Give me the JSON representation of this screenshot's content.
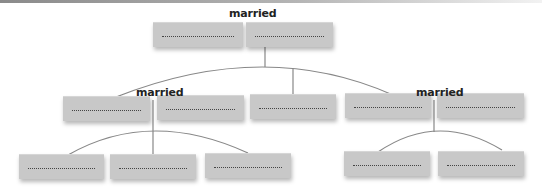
{
  "diagram": {
    "type": "family-tree",
    "relationship_label": "married",
    "colors": {
      "box_fill": "#c8c8c8",
      "field_line": "#444444",
      "connector": "#888888",
      "label_text": "#222222"
    },
    "generations": [
      {
        "name": "grandparents",
        "couples": [
          {
            "label": "married",
            "members": [
              {
                "name": ""
              },
              {
                "name": ""
              }
            ]
          }
        ]
      },
      {
        "name": "parents",
        "couples": [
          {
            "label": "married",
            "members": [
              {
                "name": ""
              },
              {
                "name": ""
              }
            ]
          },
          {
            "label": "",
            "members": [
              {
                "name": ""
              }
            ]
          },
          {
            "label": "married",
            "members": [
              {
                "name": ""
              },
              {
                "name": ""
              }
            ]
          }
        ]
      },
      {
        "name": "children",
        "groups": [
          {
            "members": [
              {
                "name": ""
              },
              {
                "name": ""
              },
              {
                "name": ""
              }
            ]
          },
          {
            "members": [
              {
                "name": ""
              },
              {
                "name": ""
              }
            ]
          }
        ]
      }
    ],
    "labels": [
      "married",
      "married",
      "married"
    ]
  }
}
